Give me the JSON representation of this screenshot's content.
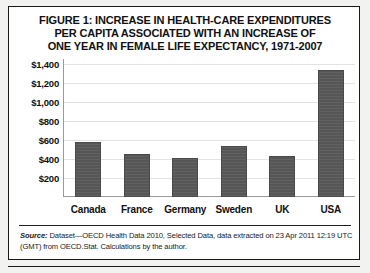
{
  "figure": {
    "title_lines": [
      "FIGURE 1: INCREASE IN HEALTH-CARE EXPENDITURES",
      "PER CAPITA ASSOCIATED WITH AN INCREASE OF",
      "ONE YEAR IN FEMALE LIFE EXPECTANCY, 1971-2007"
    ],
    "source_label": "Source:",
    "source_text": " Dataset—OECD Health Data 2010, Selected Data, data extracted on 23 Apr 2011 12:19 UTC (GMT) from OECD.Stat. Calculations by the author."
  },
  "colors": {
    "bar_fill": "#565656",
    "bar_border": "#4a4a4a",
    "axis": "#9a9a9a",
    "gridline": "#e3e3e3",
    "border": "#1a1a1a",
    "text": "#111111",
    "card_background": "#ffffff"
  },
  "chart_data": {
    "type": "bar",
    "title": "FIGURE 1: INCREASE IN HEALTH-CARE EXPENDITURES PER CAPITA ASSOCIATED WITH AN INCREASE OF ONE YEAR IN FEMALE LIFE EXPECTANCY, 1971-2007",
    "xlabel": "",
    "ylabel": "",
    "categories": [
      "Canada",
      "France",
      "Germany",
      "Sweden",
      "UK",
      "USA"
    ],
    "values": [
      580,
      450,
      410,
      540,
      435,
      1330
    ],
    "ylim": [
      0,
      1450
    ],
    "yticks": [
      200,
      400,
      600,
      800,
      1000,
      1200,
      1400
    ],
    "ytick_labels": [
      "$200",
      "$400",
      "$600",
      "$800",
      "$1,000",
      "$1,200",
      "$1,400"
    ],
    "grid": true,
    "legend": false
  }
}
